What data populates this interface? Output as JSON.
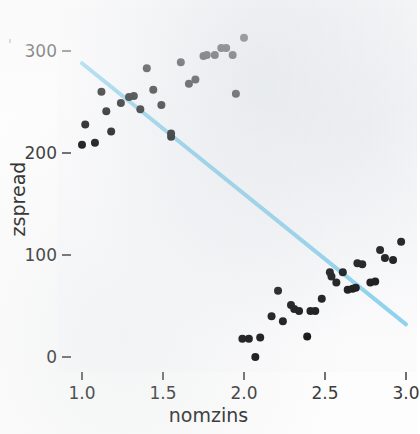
{
  "figure": {
    "background_color": "#fdfdfd",
    "panel_color": "#fbfbfc"
  },
  "chart_data": {
    "type": "scatter",
    "title": "",
    "xlabel": "nomzins",
    "ylabel": "zspread",
    "xlim": [
      0.93,
      3.05
    ],
    "ylim": [
      -20,
      330
    ],
    "xticks": [
      1.0,
      1.5,
      2.0,
      2.5,
      3.0
    ],
    "xtick_labels": [
      "1.0",
      "1.5",
      "2.0",
      "2.5",
      "3.0"
    ],
    "yticks": [
      0,
      100,
      200,
      300
    ],
    "ytick_labels": [
      "0",
      "100",
      "200",
      "300"
    ],
    "grid": false,
    "legend": "none",
    "point_color": "#121212",
    "point_size": 8,
    "series": [
      {
        "name": "zspread vs nomzins",
        "points": [
          [
            1.0,
            208
          ],
          [
            1.02,
            228
          ],
          [
            1.08,
            210
          ],
          [
            1.12,
            260
          ],
          [
            1.15,
            241
          ],
          [
            1.18,
            221
          ],
          [
            1.24,
            249
          ],
          [
            1.29,
            255
          ],
          [
            1.32,
            256
          ],
          [
            1.36,
            243
          ],
          [
            1.4,
            283
          ],
          [
            1.44,
            262
          ],
          [
            1.49,
            247
          ],
          [
            1.55,
            219
          ],
          [
            1.55,
            216
          ],
          [
            1.61,
            289
          ],
          [
            1.66,
            268
          ],
          [
            1.7,
            272
          ],
          [
            1.75,
            295
          ],
          [
            1.77,
            296
          ],
          [
            1.82,
            296
          ],
          [
            1.86,
            303
          ],
          [
            1.89,
            303
          ],
          [
            1.93,
            296
          ],
          [
            1.95,
            258
          ],
          [
            2.0,
            313
          ],
          [
            1.99,
            18
          ],
          [
            2.03,
            18
          ],
          [
            2.07,
            0
          ],
          [
            2.1,
            19
          ],
          [
            2.17,
            40
          ],
          [
            2.21,
            65
          ],
          [
            2.24,
            35
          ],
          [
            2.29,
            51
          ],
          [
            2.31,
            47
          ],
          [
            2.34,
            45
          ],
          [
            2.39,
            20
          ],
          [
            2.41,
            45
          ],
          [
            2.44,
            45
          ],
          [
            2.48,
            57
          ],
          [
            2.53,
            83
          ],
          [
            2.54,
            79
          ],
          [
            2.57,
            73
          ],
          [
            2.61,
            83
          ],
          [
            2.64,
            66
          ],
          [
            2.67,
            67
          ],
          [
            2.69,
            68
          ],
          [
            2.7,
            92
          ],
          [
            2.73,
            91
          ],
          [
            2.78,
            73
          ],
          [
            2.81,
            74
          ],
          [
            2.84,
            105
          ],
          [
            2.87,
            97
          ],
          [
            2.92,
            95
          ],
          [
            2.97,
            113
          ]
        ]
      }
    ],
    "trend_line": {
      "name": "linear fit",
      "color": "#8fd3ee",
      "width": 4,
      "x_start": 1.0,
      "y_start": 288,
      "x_end": 3.0,
      "y_end": 32,
      "slope": -128,
      "intercept": 416
    }
  }
}
